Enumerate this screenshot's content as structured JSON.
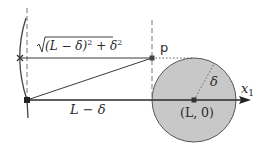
{
  "diagram": {
    "title": "",
    "labels": {
      "hypotenuse": "√(L − δ)² + δ²",
      "hypotenuse_radicand": "(L − δ)",
      "hypotenuse_sq": "2",
      "hypotenuse_plus": " + δ",
      "hypotenuse_sq2": "2",
      "base": "L − δ",
      "point_p": "p",
      "radius": "δ",
      "center": "(L, 0)",
      "axis": "x",
      "axis_sub": "1"
    },
    "colors": {
      "stroke": "#3a3a3a",
      "circle_fill": "#c8c8c8",
      "circle_stroke": "#555555",
      "dashed": "#777777",
      "marker": "#222222"
    },
    "elements": {
      "origin_point": {
        "x": 27,
        "y": 100
      },
      "cross_point": {
        "x": 20,
        "y": 58
      },
      "point_p": {
        "x": 152,
        "y": 58
      },
      "circle_center": {
        "x": 194,
        "y": 100
      },
      "circle_radius": 42,
      "axis_end": {
        "x": 251,
        "y": 100
      }
    }
  }
}
